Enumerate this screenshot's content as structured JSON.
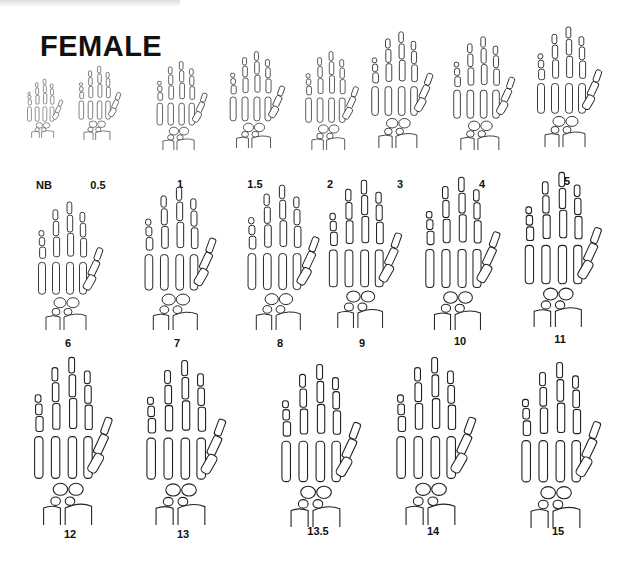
{
  "title": "FEMALE",
  "rows": [
    {
      "items": [
        {
          "label": "NB",
          "cx": 44,
          "top": 78,
          "h": 60,
          "scale": 0.55,
          "lblY": 179
        },
        {
          "label": "0.5",
          "cx": 98,
          "top": 65,
          "h": 75,
          "scale": 0.65,
          "lblY": 179
        },
        {
          "label": "1",
          "cx": 180,
          "top": 60,
          "h": 90,
          "scale": 0.78,
          "lblY": 178
        },
        {
          "label": "1.5",
          "cx": 255,
          "top": 50,
          "h": 98,
          "scale": 0.85,
          "lblY": 178
        },
        {
          "label": "2",
          "cx": 330,
          "top": 50,
          "h": 100,
          "scale": 0.82,
          "lblY": 178
        },
        {
          "label": "3",
          "cx": 400,
          "top": 30,
          "h": 118,
          "scale": 0.95,
          "lblY": 178
        },
        {
          "label": "4",
          "cx": 482,
          "top": 35,
          "h": 115,
          "scale": 0.95,
          "lblY": 178
        },
        {
          "label": "5",
          "cx": 567,
          "top": 25,
          "h": 122,
          "scale": 1.0,
          "lblY": 175
        }
      ]
    },
    {
      "items": [
        {
          "label": "6",
          "cx": 68,
          "top": 200,
          "h": 130,
          "scale": 1.0,
          "lblY": 337
        },
        {
          "label": "7",
          "cx": 177,
          "top": 185,
          "h": 145,
          "scale": 1.1,
          "lblY": 337
        },
        {
          "label": "8",
          "cx": 280,
          "top": 183,
          "h": 147,
          "scale": 1.1,
          "lblY": 337
        },
        {
          "label": "9",
          "cx": 362,
          "top": 178,
          "h": 150,
          "scale": 1.12,
          "lblY": 337
        },
        {
          "label": "10",
          "cx": 460,
          "top": 175,
          "h": 155,
          "scale": 1.15,
          "lblY": 335
        },
        {
          "label": "11",
          "cx": 560,
          "top": 170,
          "h": 157,
          "scale": 1.18,
          "lblY": 333
        }
      ]
    },
    {
      "items": [
        {
          "label": "12",
          "cx": 70,
          "top": 355,
          "h": 170,
          "scale": 1.2,
          "lblY": 528
        },
        {
          "label": "13",
          "cx": 183,
          "top": 358,
          "h": 167,
          "scale": 1.22,
          "lblY": 528
        },
        {
          "label": "13.5",
          "cx": 318,
          "top": 362,
          "h": 165,
          "scale": 1.22,
          "lblY": 525
        },
        {
          "label": "14",
          "cx": 433,
          "top": 355,
          "h": 170,
          "scale": 1.22,
          "lblY": 525
        },
        {
          "label": "15",
          "cx": 558,
          "top": 360,
          "h": 168,
          "scale": 1.22,
          "lblY": 525
        }
      ]
    }
  ]
}
